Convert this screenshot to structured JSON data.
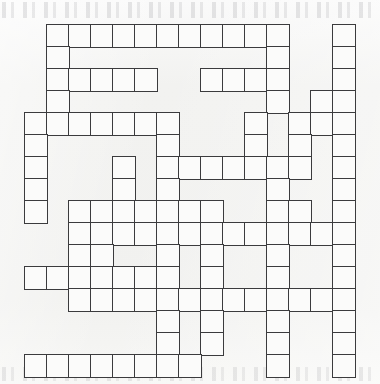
{
  "puzzle": {
    "type": "crossword-grid",
    "title": "Crossword puzzle grid",
    "description": "Blank criss-cross / fill-in crossword grid printed on off-white paper",
    "geometry": {
      "origin_x": 24,
      "origin_y": 24,
      "cell_size": 22,
      "columns": 16,
      "rows": 16,
      "border_width": 1.6
    },
    "colors": {
      "page_background": "#f3f3f1",
      "cell_fill": "#fbfbfa",
      "cell_border": "#3b3b3d",
      "bleed_text": "#50505a"
    },
    "cell_count": 172,
    "cells": [
      [
        0,
        1
      ],
      [
        0,
        2
      ],
      [
        0,
        3
      ],
      [
        0,
        4
      ],
      [
        0,
        5
      ],
      [
        0,
        6
      ],
      [
        0,
        7
      ],
      [
        0,
        8
      ],
      [
        0,
        9
      ],
      [
        0,
        10
      ],
      [
        0,
        11
      ],
      [
        0,
        14
      ],
      [
        1,
        1
      ],
      [
        1,
        11
      ],
      [
        1,
        14
      ],
      [
        2,
        1
      ],
      [
        2,
        2
      ],
      [
        2,
        3
      ],
      [
        2,
        4
      ],
      [
        2,
        5
      ],
      [
        2,
        8
      ],
      [
        2,
        9
      ],
      [
        2,
        10
      ],
      [
        2,
        11
      ],
      [
        2,
        14
      ],
      [
        3,
        1
      ],
      [
        3,
        11
      ],
      [
        3,
        13
      ],
      [
        3,
        14
      ],
      [
        4,
        0
      ],
      [
        4,
        1
      ],
      [
        4,
        2
      ],
      [
        4,
        3
      ],
      [
        4,
        4
      ],
      [
        4,
        5
      ],
      [
        4,
        6
      ],
      [
        4,
        10
      ],
      [
        4,
        12
      ],
      [
        4,
        13
      ],
      [
        4,
        14
      ],
      [
        5,
        0
      ],
      [
        5,
        6
      ],
      [
        5,
        10
      ],
      [
        5,
        12
      ],
      [
        5,
        14
      ],
      [
        6,
        0
      ],
      [
        6,
        4
      ],
      [
        6,
        6
      ],
      [
        6,
        7
      ],
      [
        6,
        8
      ],
      [
        6,
        9
      ],
      [
        6,
        10
      ],
      [
        6,
        11
      ],
      [
        6,
        12
      ],
      [
        6,
        14
      ],
      [
        7,
        0
      ],
      [
        7,
        4
      ],
      [
        7,
        6
      ],
      [
        7,
        11
      ],
      [
        7,
        14
      ],
      [
        8,
        0
      ],
      [
        8,
        2
      ],
      [
        8,
        3
      ],
      [
        8,
        4
      ],
      [
        8,
        5
      ],
      [
        8,
        6
      ],
      [
        8,
        7
      ],
      [
        8,
        8
      ],
      [
        8,
        11
      ],
      [
        8,
        12
      ],
      [
        8,
        14
      ],
      [
        9,
        2
      ],
      [
        9,
        3
      ],
      [
        9,
        4
      ],
      [
        9,
        5
      ],
      [
        9,
        6
      ],
      [
        9,
        7
      ],
      [
        9,
        8
      ],
      [
        9,
        9
      ],
      [
        9,
        10
      ],
      [
        9,
        11
      ],
      [
        9,
        12
      ],
      [
        9,
        13
      ],
      [
        9,
        14
      ],
      [
        10,
        2
      ],
      [
        10,
        3
      ],
      [
        10,
        6
      ],
      [
        10,
        8
      ],
      [
        10,
        11
      ],
      [
        10,
        14
      ],
      [
        11,
        0
      ],
      [
        11,
        1
      ],
      [
        11,
        2
      ],
      [
        11,
        3
      ],
      [
        11,
        4
      ],
      [
        11,
        5
      ],
      [
        11,
        6
      ],
      [
        11,
        8
      ],
      [
        11,
        11
      ],
      [
        11,
        14
      ],
      [
        12,
        2
      ],
      [
        12,
        3
      ],
      [
        12,
        4
      ],
      [
        12,
        5
      ],
      [
        12,
        6
      ],
      [
        12,
        7
      ],
      [
        12,
        8
      ],
      [
        12,
        9
      ],
      [
        12,
        10
      ],
      [
        12,
        11
      ],
      [
        12,
        12
      ],
      [
        12,
        13
      ],
      [
        12,
        14
      ],
      [
        13,
        6
      ],
      [
        13,
        8
      ],
      [
        13,
        11
      ],
      [
        13,
        14
      ],
      [
        14,
        6
      ],
      [
        14,
        8
      ],
      [
        14,
        11
      ],
      [
        14,
        14
      ],
      [
        15,
        0
      ],
      [
        15,
        1
      ],
      [
        15,
        2
      ],
      [
        15,
        3
      ],
      [
        15,
        4
      ],
      [
        15,
        5
      ],
      [
        15,
        6
      ],
      [
        15,
        7
      ],
      [
        15,
        11
      ],
      [
        15,
        14
      ]
    ]
  }
}
